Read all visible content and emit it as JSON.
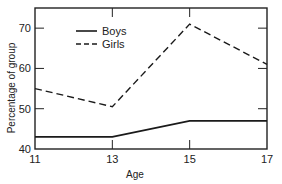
{
  "chart_data": {
    "type": "line",
    "title": "",
    "xlabel": "Age",
    "ylabel": "Percentage of group",
    "x": [
      11,
      13,
      15,
      17
    ],
    "x_tick_labels": [
      "11",
      "13",
      "15",
      "17"
    ],
    "y_tick_labels": [
      "40",
      "50",
      "60",
      "70"
    ],
    "ylim": [
      40,
      75
    ],
    "xlim": [
      11,
      17
    ],
    "grid": false,
    "legend_position": "upper-left",
    "series": [
      {
        "name": "Boys",
        "style": "solid",
        "values": [
          43,
          43,
          47,
          47
        ]
      },
      {
        "name": "Girls",
        "style": "dashed",
        "values": [
          55,
          50.5,
          71,
          61
        ]
      }
    ]
  },
  "legend": {
    "boys": "Boys",
    "girls": "Girls"
  },
  "axes": {
    "xlabel": "Age",
    "ylabel": "Percentage of group"
  },
  "colors": {
    "line": "#1a1a1a",
    "axis": "#222222",
    "background": "#ffffff"
  }
}
